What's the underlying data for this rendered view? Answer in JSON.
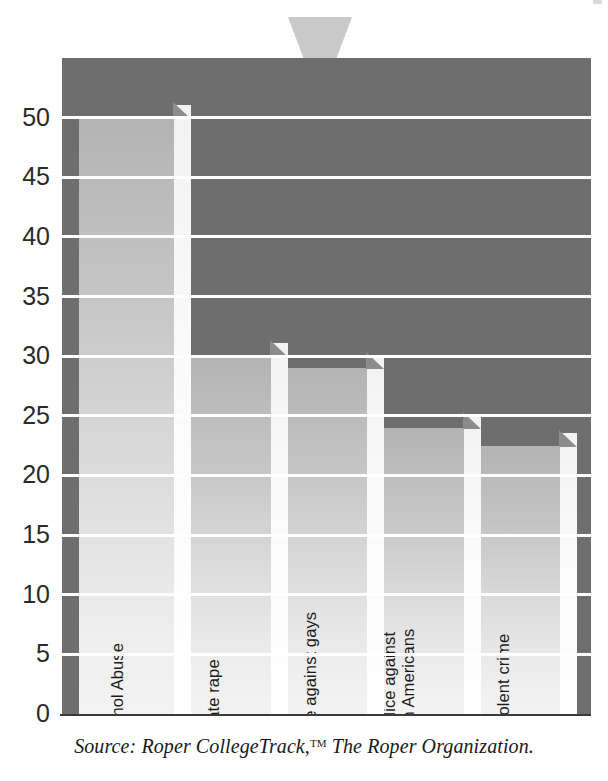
{
  "caption": {
    "prefix": "Source: Roper CollegeTrack,",
    "trademark": "TM",
    "suffix": " The Roper Organization."
  },
  "icons": {
    "pointer": "triangle-down-icon",
    "speck": "corner-speck-icon"
  },
  "colors": {
    "plot_background": "#6e6e6e",
    "gridline": "#ffffff",
    "bar_face_light": "#f3f3f3",
    "bar_face_dark": "#b3b3b3",
    "bar_side": "#ffffff",
    "pointer": "#c9c9c9",
    "text": "#1c1c1c"
  },
  "chart_data": {
    "type": "bar",
    "title": "",
    "subtitle": "",
    "xlabel": "",
    "ylabel": "",
    "ylim": [
      0,
      55
    ],
    "grid": true,
    "legend": "none",
    "orientation": "vertical",
    "yticks": [
      0,
      5,
      10,
      15,
      20,
      25,
      30,
      35,
      40,
      45,
      50
    ],
    "ytick_labels": [
      "0",
      "5",
      "10",
      "15",
      "20",
      "25",
      "30",
      "35",
      "40",
      "45",
      "50"
    ],
    "categories": [
      "Alcohol Abuse",
      "Date rape",
      "Prejudice against gays",
      "Prejudice against African Americans",
      "Nonviolent crime"
    ],
    "values": [
      50,
      30,
      29,
      24,
      22.5
    ],
    "bars": [
      {
        "label": "Alcohol Abuse",
        "label_lines": [
          "Alcohol Abuse"
        ],
        "value": 50
      },
      {
        "label": "Date rape",
        "label_lines": [
          "Date rape"
        ],
        "value": 30
      },
      {
        "label": "Prejudice against gays",
        "label_lines": [
          "Prejudice against gays"
        ],
        "value": 29
      },
      {
        "label": "Prejudice against African Americans",
        "label_lines": [
          "Prejudice against",
          "African Americans"
        ],
        "value": 24
      },
      {
        "label": "Nonviolent crime",
        "label_lines": [
          "Nonviolent crime"
        ],
        "value": 22.5
      }
    ]
  }
}
